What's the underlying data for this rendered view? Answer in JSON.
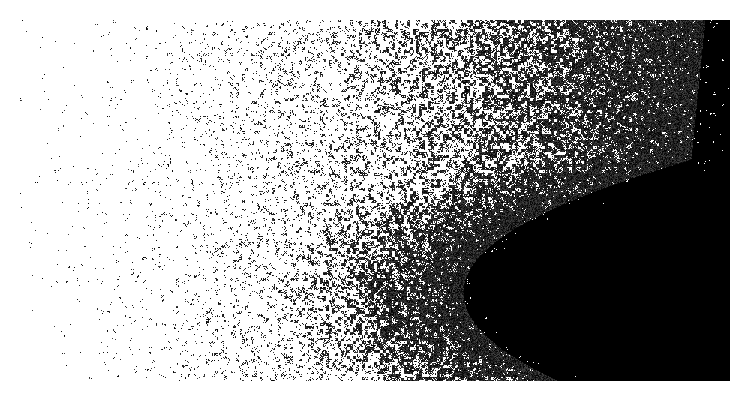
{
  "image": {
    "description": "stipple noise gradient, sparse white to dense black",
    "canvas": {
      "width": 748,
      "height": 408,
      "background": "#ffffff"
    },
    "field": {
      "x": 20,
      "y": 20,
      "width": 710,
      "height": 361
    },
    "ink_color": "#000000",
    "gradient": {
      "direction": "left-to-right with darkest region bottom-right",
      "start_density": 0.03,
      "end_density": 1.0,
      "dark_center": {
        "x": 0.85,
        "y": 0.75
      }
    },
    "seed": 12345
  }
}
